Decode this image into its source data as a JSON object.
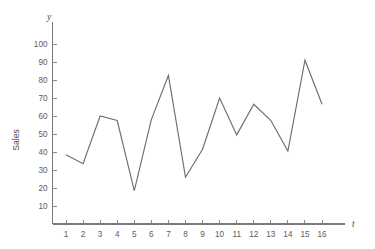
{
  "chart_data": {
    "type": "line",
    "title": "",
    "subtitle": "",
    "xlabel": "t",
    "ylabel": "Sales",
    "y_axis_symbol": "y",
    "x_axis_symbol": "t",
    "grid": false,
    "legend": null,
    "legend_position": "none",
    "xlim": [
      0,
      17
    ],
    "ylim": [
      0,
      108
    ],
    "x": [
      1,
      2,
      3,
      4,
      5,
      6,
      7,
      8,
      9,
      10,
      11,
      12,
      13,
      14,
      15,
      16
    ],
    "values": [
      38.5,
      33.5,
      60.0,
      57.5,
      18.5,
      58.0,
      82.5,
      26.0,
      41.5,
      70.0,
      49.5,
      66.5,
      57.5,
      40.5,
      91.0,
      66.5
    ],
    "series": [
      {
        "name": "Sales",
        "values": [
          38.5,
          33.5,
          60.0,
          57.5,
          18.5,
          58.0,
          82.5,
          26.0,
          41.5,
          70.0,
          49.5,
          66.5,
          57.5,
          40.5,
          91.0,
          66.5
        ],
        "color": "#6e6e6e"
      }
    ],
    "x_tick_labels": [
      "1",
      "2",
      "3",
      "4",
      "5",
      "6",
      "7",
      "8",
      "9",
      "10",
      "11",
      "12",
      "13",
      "14",
      "15",
      "16"
    ],
    "y_tick_labels": [
      "10",
      "20",
      "30",
      "40",
      "50",
      "60",
      "70",
      "80",
      "90",
      "100"
    ],
    "y_tick_values": [
      10,
      20,
      30,
      40,
      50,
      60,
      70,
      80,
      90,
      100
    ],
    "annotations": []
  },
  "colors": {
    "background": "#ffffff",
    "line": "#6e6e6e",
    "axis": "#7a7a7a",
    "tick": "#8a8a8a",
    "text": "#5c5c5c"
  }
}
